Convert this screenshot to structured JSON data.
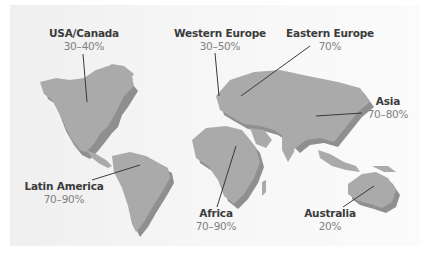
{
  "map": {
    "type": "world-map-callouts",
    "land_color": "#aaaaaa",
    "shadow_color": "#8f8f8f",
    "background_color": "#f4f4f4"
  },
  "regions": [
    {
      "name": "USA/Canada",
      "value": "30–40%"
    },
    {
      "name": "Western Europe",
      "value": "30–50%"
    },
    {
      "name": "Eastern Europe",
      "value": "70%"
    },
    {
      "name": "Asia",
      "value": "70–80%"
    },
    {
      "name": "Latin America",
      "value": "70–90%"
    },
    {
      "name": "Africa",
      "value": "70–90%"
    },
    {
      "name": "Australia",
      "value": "20%"
    }
  ]
}
